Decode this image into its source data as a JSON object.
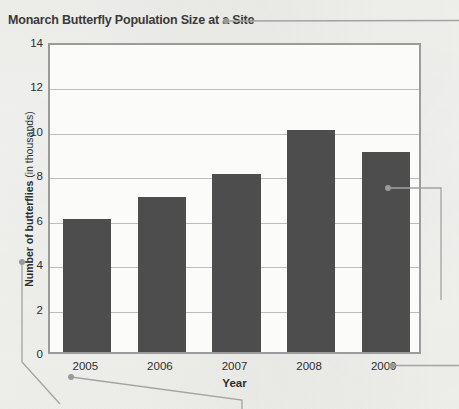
{
  "chart_data": {
    "type": "bar",
    "title": "Monarch Butterfly Population Size at a Site",
    "xlabel": "Year",
    "ylabel": "Number of butterflies (in thousands)",
    "ylabel_name": "Number of butterflies",
    "ylabel_unit": " (in thousands)",
    "categories": [
      "2005",
      "2006",
      "2007",
      "2008",
      "2009"
    ],
    "values": [
      6,
      7,
      8,
      10,
      9
    ],
    "ylim": [
      0,
      14
    ],
    "ytick_values": [
      0,
      2,
      4,
      6,
      8,
      10,
      12,
      14
    ],
    "ytick_labels": [
      "0",
      "2",
      "4",
      "6",
      "8",
      "10",
      "12",
      "14"
    ],
    "grid": true,
    "grid_axis": "y",
    "legend": false,
    "bar_color": "#4d4d4d",
    "frame_color": "#9b9b9b",
    "grid_color": "#bdbdbd",
    "background_color": "#f7f7f5"
  },
  "annotations": {
    "leader_color": "#9a9a9a",
    "callouts": [
      {
        "name": "title-callout",
        "target": "chart title"
      },
      {
        "name": "y-axis-label-callout",
        "target": "Number of butterflies (in thousands)"
      },
      {
        "name": "x-axis-2005-callout",
        "target": "2005"
      },
      {
        "name": "x-axis-2009-callout",
        "target": "2009"
      },
      {
        "name": "bar-2009-callout",
        "target": "2009 bar"
      }
    ]
  }
}
